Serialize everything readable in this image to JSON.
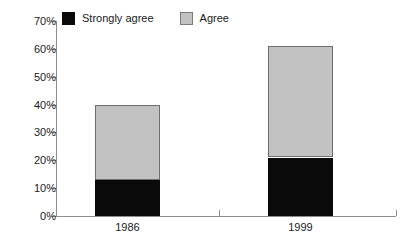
{
  "legend": {
    "entries": [
      {
        "label": "Strongly agree",
        "color": "#0a0a0a"
      },
      {
        "label": "Agree",
        "color": "#c2c2c2"
      }
    ]
  },
  "axis": {
    "y_ticks": [
      "0%",
      "10%",
      "20%",
      "30%",
      "40%",
      "50%",
      "60%",
      "70%"
    ],
    "x_labels": [
      "1986",
      "1999"
    ]
  },
  "chart_data": {
    "type": "bar",
    "stacked": true,
    "title": "",
    "xlabel": "",
    "ylabel": "",
    "ylim": [
      0,
      70
    ],
    "ytick_step": 10,
    "ytick_format": "percent",
    "grid": false,
    "legend_position": "top",
    "categories": [
      "1986",
      "1999"
    ],
    "series": [
      {
        "name": "Strongly agree",
        "color": "#0a0a0a",
        "values": [
          13,
          21
        ]
      },
      {
        "name": "Agree",
        "color": "#c2c2c2",
        "values": [
          27,
          40
        ]
      }
    ],
    "totals": [
      40,
      61
    ]
  }
}
